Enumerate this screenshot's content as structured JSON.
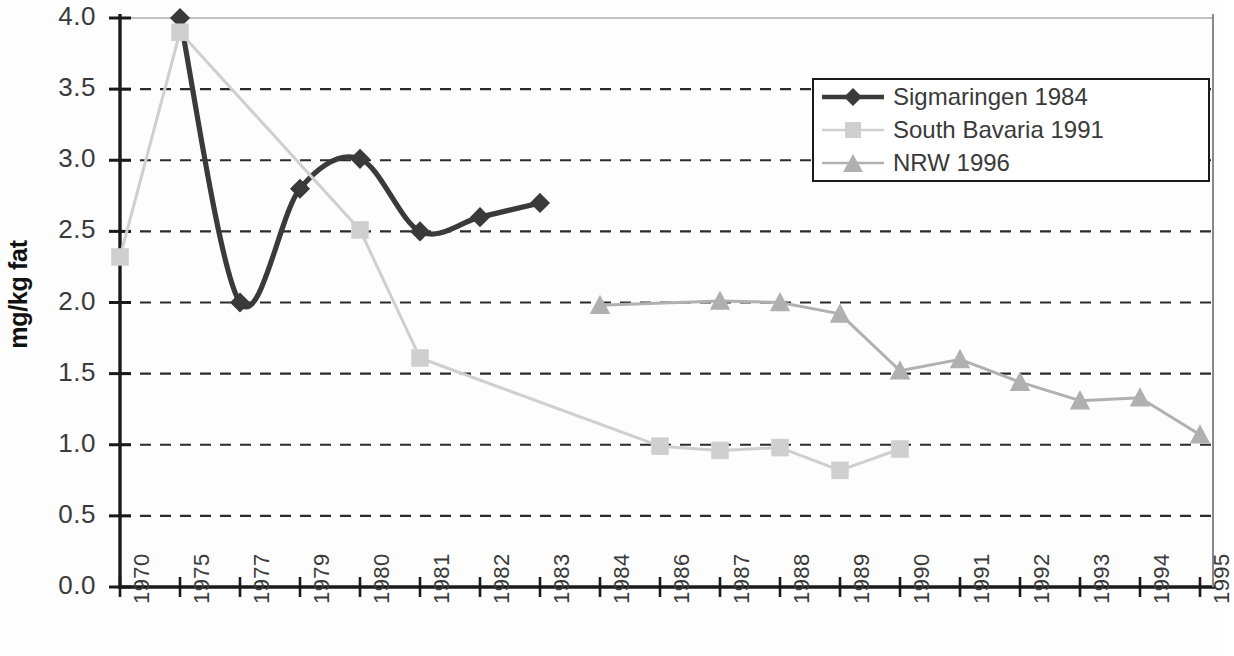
{
  "chart_data": {
    "type": "line",
    "title": "",
    "xlabel": "",
    "ylabel": "mg/kg fat",
    "ylim": [
      0.0,
      4.0
    ],
    "ytick_labels": [
      "0.0",
      "0.5",
      "1.0",
      "1.5",
      "2.0",
      "2.5",
      "3.0",
      "3.5",
      "4.0"
    ],
    "ytick_values": [
      0.0,
      0.5,
      1.0,
      1.5,
      2.0,
      2.5,
      3.0,
      3.5,
      4.0
    ],
    "grid": "horizontal-dashed",
    "legend_position": "top-right",
    "categories": [
      "1970",
      "1975",
      "1977",
      "1979",
      "1980",
      "1981",
      "1982",
      "1983",
      "1984",
      "1986",
      "1987",
      "1988",
      "1989",
      "1990",
      "1991",
      "1992",
      "1993",
      "1994",
      "1995"
    ],
    "series": [
      {
        "name": "Sigmaringen 1984",
        "marker": "diamond",
        "color": "#3a3a3a",
        "smooth": true,
        "values": [
          null,
          4.0,
          2.0,
          2.8,
          3.01,
          2.5,
          2.6,
          2.7,
          null,
          null,
          null,
          null,
          null,
          null,
          null,
          null,
          null,
          null,
          null
        ]
      },
      {
        "name": "South Bavaria 1991",
        "marker": "square",
        "color": "#cfcfcf",
        "smooth": false,
        "values": [
          2.32,
          3.9,
          null,
          null,
          2.51,
          1.61,
          null,
          null,
          null,
          0.99,
          0.96,
          0.98,
          0.82,
          0.97,
          null,
          null,
          null,
          null,
          null
        ]
      },
      {
        "name": "NRW 1996",
        "marker": "triangle",
        "color": "#b0b0b0",
        "smooth": false,
        "values": [
          null,
          null,
          null,
          null,
          null,
          null,
          null,
          null,
          1.98,
          null,
          2.01,
          2.0,
          1.92,
          1.52,
          1.6,
          1.44,
          1.31,
          1.33,
          1.07
        ]
      }
    ],
    "extra_connector": {
      "description": "thin light line from 1975 peak of South Bavaria down to its 1980 point",
      "from": {
        "category": "1975",
        "value": 3.9
      },
      "to": {
        "category": "1980",
        "value": 2.51
      }
    }
  },
  "legend": {
    "items": [
      {
        "label": "Sigmaringen 1984",
        "marker": "diamond",
        "color": "#3a3a3a"
      },
      {
        "label": "South Bavaria 1991",
        "marker": "square",
        "color": "#cfcfcf"
      },
      {
        "label": "NRW 1996",
        "marker": "triangle",
        "color": "#b0b0b0"
      }
    ]
  },
  "axes": {
    "y_axis_title": "mg/kg fat"
  }
}
